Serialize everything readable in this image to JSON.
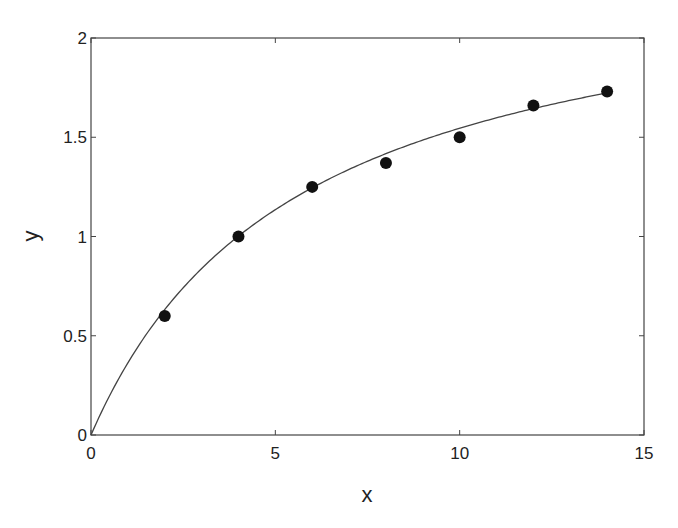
{
  "chart_data": {
    "type": "scatter",
    "title": "",
    "xlabel": "x",
    "ylabel": "y",
    "xlim": [
      0,
      15
    ],
    "ylim": [
      0,
      2
    ],
    "xticks": [
      0,
      5,
      10,
      15
    ],
    "yticks": [
      0,
      0.5,
      1,
      1.5,
      2
    ],
    "xtick_labels": [
      "0",
      "5",
      "10",
      "15"
    ],
    "ytick_labels": [
      "0",
      "0.5",
      "1",
      "1.5",
      "2"
    ],
    "grid": false,
    "legend": null,
    "series": [
      {
        "name": "data",
        "type": "scatter",
        "marker": "filled-circle",
        "color": "#111111",
        "x": [
          2,
          4,
          6,
          8,
          10,
          12,
          14
        ],
        "y": [
          0.6,
          1.0,
          1.25,
          1.37,
          1.5,
          1.66,
          1.73
        ]
      },
      {
        "name": "fit",
        "type": "line",
        "color": "#444444",
        "model": "y = a*x/(b+x)",
        "params": {
          "a": 2.42,
          "b": 5.66
        },
        "x_range": [
          0,
          14
        ]
      }
    ]
  },
  "colors": {
    "axes": "#444444",
    "marker": "#111111",
    "curve": "#444444",
    "text": "#222222"
  }
}
